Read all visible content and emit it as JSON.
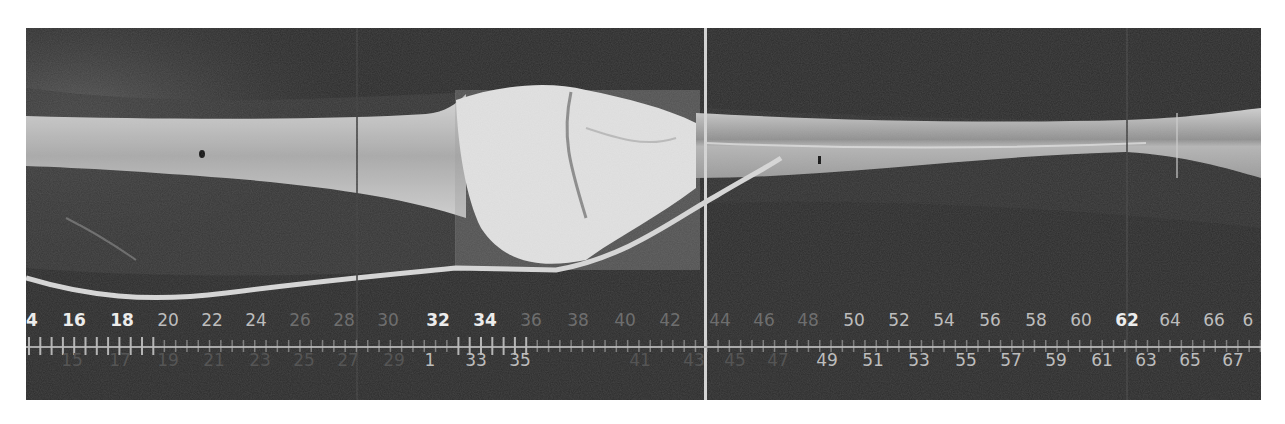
{
  "image": {
    "subject": "radiograph-long-bone-composite",
    "background_color": "#2c2c2c",
    "frame_color": "#ffffff"
  },
  "ruler": {
    "top_labels": [
      "14",
      "16",
      "18",
      "20",
      "22",
      "24",
      "26",
      "28",
      "30",
      "32",
      "34",
      "36",
      "38",
      "40",
      "42",
      "44",
      "46",
      "48",
      "50",
      "52",
      "54",
      "56",
      "58",
      "60",
      "62",
      "64",
      "66",
      "6"
    ],
    "bottom_labels": [
      "3",
      "15",
      "17",
      "19",
      "21",
      "23",
      "25",
      "27",
      "29",
      "1",
      "33",
      "35",
      "41",
      "43",
      "45",
      "47",
      "49",
      "51",
      "53",
      "55",
      "57",
      "59",
      "61",
      "63",
      "65",
      "67"
    ]
  }
}
